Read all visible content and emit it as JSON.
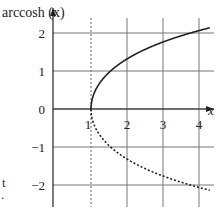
{
  "chart_data": {
    "type": "line",
    "title": "",
    "xlabel": "x",
    "ylabel": "arccosh (x)",
    "xlim": [
      0,
      4.4
    ],
    "ylim": [
      -2.4,
      2.4
    ],
    "x_ticks": [
      1,
      2,
      3,
      4
    ],
    "x_tick_labels": [
      "1",
      "2",
      "3",
      "4"
    ],
    "y_ticks": [
      -2,
      -1,
      0,
      1,
      2
    ],
    "y_tick_labels": [
      "−2",
      "−1",
      "0",
      "1",
      "2"
    ],
    "grid": true,
    "vertical_reference_line": {
      "x": 1,
      "style": "dashed"
    },
    "series": [
      {
        "name": "arccosh(x)",
        "style": "solid",
        "color": "#222222",
        "x": [
          1.0,
          1.05,
          1.2,
          1.5,
          2.0,
          2.5,
          3.0,
          3.5,
          4.0,
          4.3
        ],
        "y": [
          0.0,
          0.31,
          0.62,
          0.96,
          1.32,
          1.57,
          1.76,
          1.92,
          2.06,
          2.14
        ]
      },
      {
        "name": "-arccosh(x)",
        "style": "dashed",
        "color": "#222222",
        "x": [
          1.0,
          1.05,
          1.2,
          1.5,
          2.0,
          2.5,
          3.0,
          3.5,
          4.0,
          4.3
        ],
        "y": [
          0.0,
          -0.31,
          -0.62,
          -0.96,
          -1.32,
          -1.57,
          -1.76,
          -1.92,
          -2.06,
          -2.14
        ]
      }
    ]
  },
  "labels": {
    "ylabel": "arccosh (x)",
    "xlabel": "x",
    "left_fragment_1": "t",
    "left_fragment_2": "."
  }
}
